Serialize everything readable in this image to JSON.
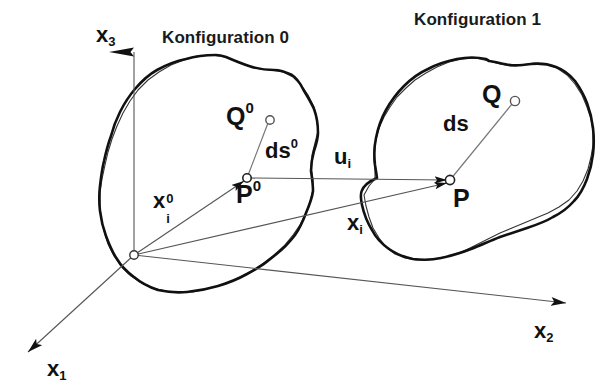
{
  "figure": {
    "caption_absent": true,
    "background_color": "#ffffff",
    "stroke_color": "#111111",
    "thin_line_color": "#555555"
  },
  "titles": {
    "configuration_0": "Konfiguration 0",
    "configuration_1": "Konfiguration 1"
  },
  "axes": [
    {
      "id": "x3",
      "base": "x",
      "sub": "3",
      "label": "x3"
    },
    {
      "id": "x2",
      "base": "x",
      "sub": "2",
      "label": "x2"
    },
    {
      "id": "x1",
      "base": "x",
      "sub": "1",
      "label": "x1"
    }
  ],
  "points": [
    {
      "id": "P0",
      "base": "P",
      "sup": "0",
      "label": "P0"
    },
    {
      "id": "Q0",
      "base": "Q",
      "sup": "0",
      "label": "Q0"
    },
    {
      "id": "P",
      "base": "P",
      "sup": "",
      "label": "P"
    },
    {
      "id": "Q",
      "base": "Q",
      "sup": "",
      "label": "Q"
    }
  ],
  "vectors": [
    {
      "id": "ds0",
      "base": "ds",
      "sup": "0",
      "label": "ds0"
    },
    {
      "id": "ds",
      "base": "ds",
      "sup": "",
      "label": "ds"
    },
    {
      "id": "ui",
      "base": "u",
      "sub": "i",
      "label": "ui"
    },
    {
      "id": "xi0",
      "base": "x",
      "sub": "i",
      "sup": "0",
      "label": "xi0"
    },
    {
      "id": "xi",
      "base": "x",
      "sub": "i",
      "label": "xi"
    }
  ],
  "geometry": {
    "origin": [
      134,
      255
    ],
    "P0": [
      247,
      178
    ],
    "Q0": [
      270,
      120
    ],
    "P": [
      450,
      180
    ],
    "Q": [
      515,
      101
    ],
    "x3_tip": [
      134,
      26
    ],
    "x2_tip": [
      568,
      303
    ],
    "x1_tip": [
      24,
      356
    ]
  }
}
